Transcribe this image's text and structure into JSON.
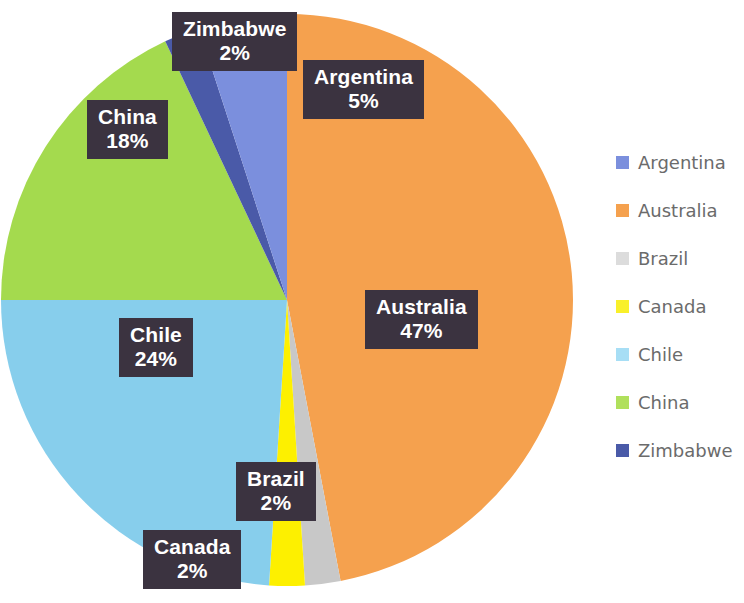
{
  "chart_data": {
    "type": "pie",
    "title": "",
    "categories": [
      "Argentina",
      "Australia",
      "Brazil",
      "Canada",
      "Chile",
      "China",
      "Zimbabwe"
    ],
    "values": [
      5,
      47,
      2,
      2,
      24,
      18,
      2
    ],
    "value_unit": "%",
    "legend_position": "right",
    "grid": false,
    "slice_order_clockwise_from_top": [
      "Australia",
      "Brazil",
      "Canada",
      "Chile",
      "China",
      "Zimbabwe",
      "Argentina"
    ],
    "colors": {
      "Argentina": "#7b8fdd",
      "Australia": "#f5a14e",
      "Brazil": "#c8c8c8",
      "Canada": "#fdf000",
      "Chile": "#87ceec",
      "China": "#a4da4e",
      "Zimbabwe": "#4a5aa8"
    },
    "legend_swatch_colors": {
      "Argentina": "#7b8fdd",
      "Australia": "#f5a14e",
      "Brazil": "#dcdcdc",
      "Canada": "#f9f02a",
      "Chile": "#a7def5",
      "China": "#b0e05c",
      "Zimbabwe": "#4a5aa8"
    },
    "label_box_color": "#3b3340",
    "label_text_color": "#ffffff",
    "legend_text_color": "#6b6b6b"
  },
  "pie": {
    "labels": [
      {
        "name": "Zimbabwe",
        "value": "2%"
      },
      {
        "name": "Argentina",
        "value": "5%"
      },
      {
        "name": "China",
        "value": "18%"
      },
      {
        "name": "Chile",
        "value": "24%"
      },
      {
        "name": "Australia",
        "value": "47%"
      },
      {
        "name": "Brazil",
        "value": "2%"
      },
      {
        "name": "Canada",
        "value": "2%"
      }
    ]
  },
  "legend": {
    "items": [
      {
        "label": "Argentina"
      },
      {
        "label": "Australia"
      },
      {
        "label": "Brazil"
      },
      {
        "label": "Canada"
      },
      {
        "label": "Chile"
      },
      {
        "label": "China"
      },
      {
        "label": "Zimbabwe"
      }
    ]
  }
}
